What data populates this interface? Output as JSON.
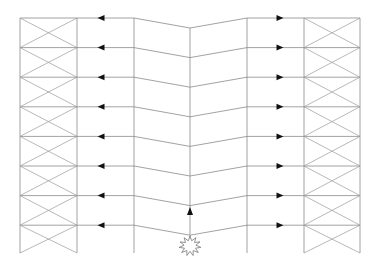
{
  "diagram": {
    "title": "",
    "floors": 8,
    "braced_bays": [
      "left",
      "right"
    ],
    "arrow_direction": {
      "left": "outward-left",
      "right": "outward-right",
      "center": "up"
    },
    "origin_icon": "explosion-starburst",
    "colors": {
      "line": "#8a8a8a",
      "arrow": "#111111",
      "background": "#ffffff"
    }
  }
}
